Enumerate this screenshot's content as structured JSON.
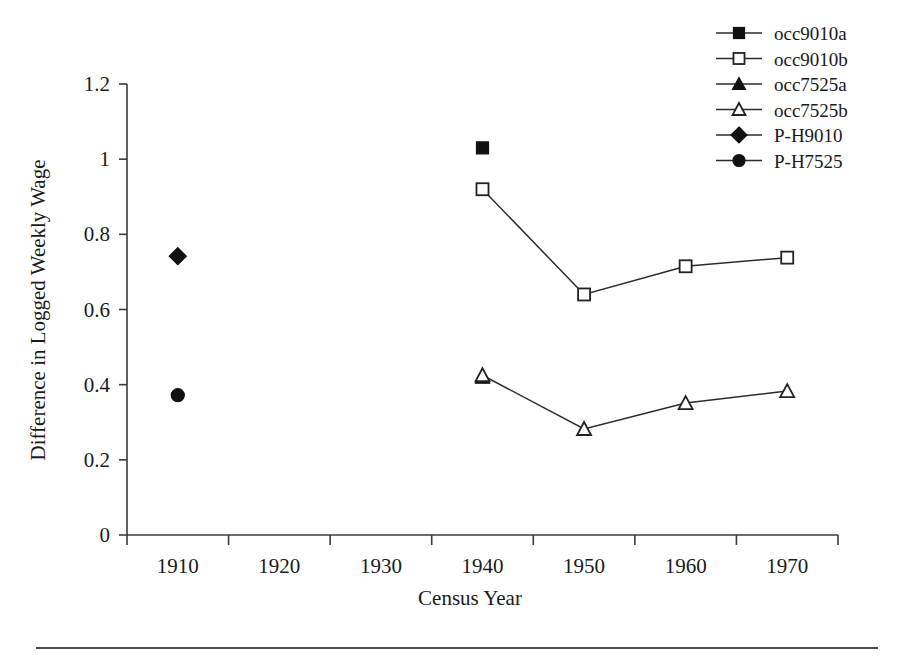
{
  "chart_data": {
    "type": "line",
    "title": "",
    "xlabel": "Census Year",
    "ylabel": "Difference in Logged Weekly Wage",
    "xlim": [
      1905,
      1975
    ],
    "ylim": [
      0,
      1.2
    ],
    "grid": false,
    "legend_position": "top-right",
    "x_ticks": [
      "1910",
      "1920",
      "1930",
      "1940",
      "1950",
      "1960",
      "1970"
    ],
    "x_tick_values": [
      1910,
      1920,
      1930,
      1940,
      1950,
      1960,
      1970
    ],
    "y_ticks": [
      "0",
      "0.2",
      "0.4",
      "0.6",
      "0.8",
      "1",
      "1.2"
    ],
    "y_tick_values": [
      0,
      0.2,
      0.4,
      0.6,
      0.8,
      1.0,
      1.2
    ],
    "series": [
      {
        "name": "occ9010a",
        "marker": "filled-square",
        "x": [
          1940
        ],
        "values": [
          1.03
        ]
      },
      {
        "name": "occ9010b",
        "marker": "open-square",
        "x": [
          1940,
          1950,
          1960,
          1970
        ],
        "values": [
          0.92,
          0.64,
          0.715,
          0.738
        ]
      },
      {
        "name": "occ7525a",
        "marker": "filled-triangle",
        "x": [
          1940
        ],
        "values": [
          0.42
        ]
      },
      {
        "name": "occ7525b",
        "marker": "open-triangle",
        "x": [
          1940,
          1950,
          1960,
          1970
        ],
        "values": [
          0.425,
          0.282,
          0.351,
          0.383
        ]
      },
      {
        "name": "P-H9010",
        "marker": "filled-diamond",
        "x": [
          1910
        ],
        "values": [
          0.742
        ]
      },
      {
        "name": "P-H7525",
        "marker": "filled-circle",
        "x": [
          1910
        ],
        "values": [
          0.372
        ]
      }
    ]
  },
  "legend": {
    "entries": [
      {
        "label": "occ9010a",
        "marker": "filled-square"
      },
      {
        "label": "occ9010b",
        "marker": "open-square"
      },
      {
        "label": "occ7525a",
        "marker": "filled-triangle"
      },
      {
        "label": "occ7525b",
        "marker": "open-triangle"
      },
      {
        "label": "P-H9010",
        "marker": "filled-diamond"
      },
      {
        "label": "P-H7525",
        "marker": "filled-circle"
      }
    ]
  },
  "colors": {
    "ink": "#1a1a1a",
    "axis": "#3a3a3a",
    "line": "#2b2b2b",
    "marker_fill": "#111111",
    "marker_open": "#ffffff",
    "background": "#ffffff"
  }
}
